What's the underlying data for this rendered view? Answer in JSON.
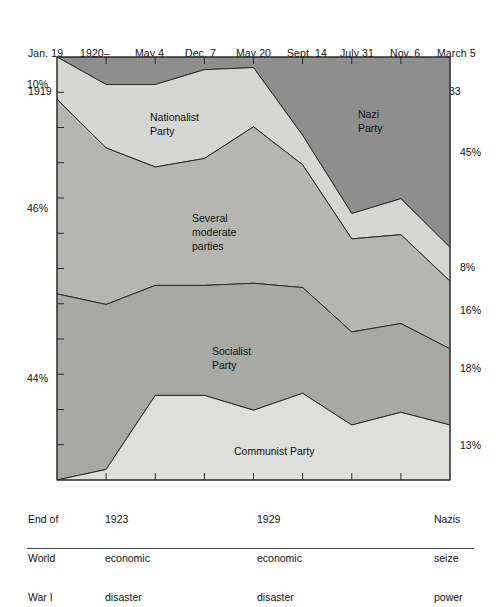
{
  "chart_data": {
    "type": "area",
    "title": "",
    "subtitle": "",
    "xlabel": "",
    "ylabel": "",
    "stacked": true,
    "normalized": true,
    "grid": false,
    "legend_position": "inline-annotations",
    "ylim": [
      0,
      100
    ],
    "categories": [
      "Jan. 19 1919",
      "1920– 1922",
      "May 4 1924",
      "Dec. 7 1924",
      "May 20 1928",
      "Sept. 14 1930",
      "July 31 1932",
      "Nov. 6 1932",
      "March 5 1933"
    ],
    "x_tick_labels": [
      {
        "line1": "Jan. 19",
        "line2": "1919"
      },
      {
        "line1": "1920–",
        "line2": "1922"
      },
      {
        "line1": "May 4",
        "line2": "1924"
      },
      {
        "line1": "Dec. 7",
        "line2": "1924"
      },
      {
        "line1": "May 20",
        "line2": "1928"
      },
      {
        "line1": "Sept. 14",
        "line2": "1930"
      },
      {
        "line1": "July 31",
        "line2": "1932"
      },
      {
        "line1": "Nov. 6",
        "line2": "1932"
      },
      {
        "line1": "March 5",
        "line2": "1933"
      }
    ],
    "series": [
      {
        "name": "Nazi Party",
        "color": "#8e8e8e",
        "values": [
          0,
          6.5,
          6.5,
          3,
          2.5,
          18.5,
          37,
          33.5,
          45
        ]
      },
      {
        "name": "Nationalist Party",
        "color": "#d6d6d2",
        "values": [
          10,
          15,
          19.5,
          21,
          14,
          7,
          6,
          8.5,
          8
        ]
      },
      {
        "name": "Several moderate parties",
        "color": "#b5b5b2",
        "values": [
          46,
          37,
          28,
          30,
          37,
          29,
          22,
          21,
          16
        ]
      },
      {
        "name": "Socialist Party",
        "color": "#a8a8a5",
        "values": [
          44,
          39,
          26,
          26,
          30,
          25,
          22,
          21,
          18
        ]
      },
      {
        "name": "Communist Party",
        "color": "#dededa",
        "values": [
          0,
          2.5,
          20,
          20,
          16.5,
          20.5,
          13,
          16,
          13
        ]
      }
    ],
    "band_annotations": [
      {
        "name": "Nationalist Party",
        "lines": [
          "Nationalist",
          "Party"
        ],
        "x": 150,
        "y": 121
      },
      {
        "name": "Nazi Party",
        "lines": [
          "Nazi",
          "Party"
        ],
        "x": 358,
        "y": 118
      },
      {
        "name": "Several moderate parties",
        "lines": [
          "Several",
          "moderate",
          "parties"
        ],
        "x": 192,
        "y": 222
      },
      {
        "name": "Socialist Party",
        "lines": [
          "Socialist",
          "Party"
        ],
        "x": 212,
        "y": 355
      },
      {
        "name": "Communist Party",
        "lines": [
          "Communist Party"
        ],
        "x": 234,
        "y": 455
      }
    ],
    "left_axis_labels": [
      {
        "text": "10%",
        "y": 84,
        "series": "Nationalist Party"
      },
      {
        "text": "46%",
        "y": 208,
        "series": "Several moderate parties"
      },
      {
        "text": "44%",
        "y": 378,
        "series": "Socialist Party"
      }
    ],
    "right_axis_labels": [
      {
        "text": "45%",
        "y": 152,
        "series": "Nazi Party"
      },
      {
        "text": "8%",
        "y": 267,
        "series": "Nationalist Party"
      },
      {
        "text": "16%",
        "y": 310,
        "series": "Several moderate parties"
      },
      {
        "text": "18%",
        "y": 368,
        "series": "Socialist Party"
      },
      {
        "text": "13%",
        "y": 445,
        "series": "Communist Party"
      }
    ],
    "event_captions": [
      {
        "lines": [
          "End of",
          "World",
          "War I"
        ],
        "x": 38
      },
      {
        "lines": [
          "1923",
          "economic",
          "disaster"
        ],
        "x": 113
      },
      {
        "lines": [
          "1929",
          "economic",
          "disaster"
        ],
        "x": 265
      },
      {
        "lines": [
          "Nazis",
          "seize",
          "power"
        ],
        "x": 435
      }
    ],
    "colors": {
      "nazi": "#8e8e8e",
      "nationalist": "#d6d6d2",
      "moderate": "#b5b5b2",
      "socialist": "#a8a8a5",
      "communist": "#dededa",
      "outline": "#2a2a2a",
      "background": "#ffffff"
    }
  }
}
